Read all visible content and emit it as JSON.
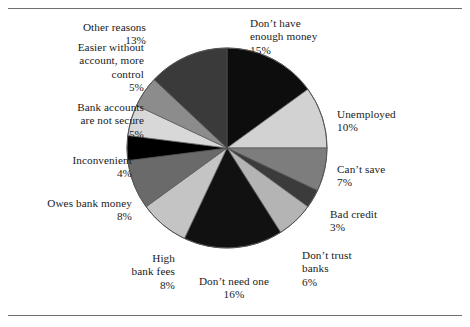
{
  "chart_data": {
    "type": "pie",
    "title": "",
    "subtitle": "",
    "xlabel": "",
    "ylabel": "",
    "legend_position": "none",
    "grid": false,
    "units": "percent",
    "total": 100,
    "start_angle_deg": 0,
    "direction": "clockwise",
    "categories": [
      "Don't have enough money",
      "Unemployed",
      "Can't save",
      "Bad credit",
      "Don't trust banks",
      "Don't need one",
      "High bank fees",
      "Owes bank money",
      "Inconvenient",
      "Bank accounts are not secure",
      "Easier without account, more control",
      "Other reasons"
    ],
    "values": [
      15,
      10,
      7,
      3,
      6,
      16,
      8,
      8,
      4,
      5,
      5,
      13
    ],
    "colors": [
      "#0d0d0d",
      "#d2d2d2",
      "#7d7d7d",
      "#3b3b3b",
      "#b4b4b4",
      "#111111",
      "#c4c4c4",
      "#6a6a6a",
      "#000000",
      "#d8d8d8",
      "#8c8c8c",
      "#3a3a3a"
    ],
    "slice_outline_color": "#555555"
  },
  "labels": [
    {
      "name": "dont-have-enough-money",
      "text": "Don’t have\nenough money\n15%",
      "percent": "15%"
    },
    {
      "name": "unemployed",
      "text": "Unemployed\n10%",
      "percent": "10%"
    },
    {
      "name": "cant-save",
      "text": "Can’t save\n7%",
      "percent": "7%"
    },
    {
      "name": "bad-credit",
      "text": "Bad credit\n3%",
      "percent": "3%"
    },
    {
      "name": "dont-trust-banks",
      "text": "Don’t trust\nbanks\n6%",
      "percent": "6%"
    },
    {
      "name": "dont-need-one",
      "text": "Don’t need one\n16%",
      "percent": "16%"
    },
    {
      "name": "high-bank-fees",
      "text": "High\nbank fees\n8%",
      "percent": "8%"
    },
    {
      "name": "owes-bank-money",
      "text": "Owes bank money\n8%",
      "percent": "8%"
    },
    {
      "name": "inconvenient",
      "text": "Inconvenient\n4%",
      "percent": "4%"
    },
    {
      "name": "bank-accounts-are-not-secure",
      "text": "Bank accounts\nare not secure\n5%",
      "percent": "5%"
    },
    {
      "name": "easier-without-account-more-control",
      "text": "Easier without\naccount, more\ncontrol\n5%",
      "percent": "5%"
    },
    {
      "name": "other-reasons",
      "text": "Other reasons\n13%",
      "percent": "13%"
    }
  ]
}
